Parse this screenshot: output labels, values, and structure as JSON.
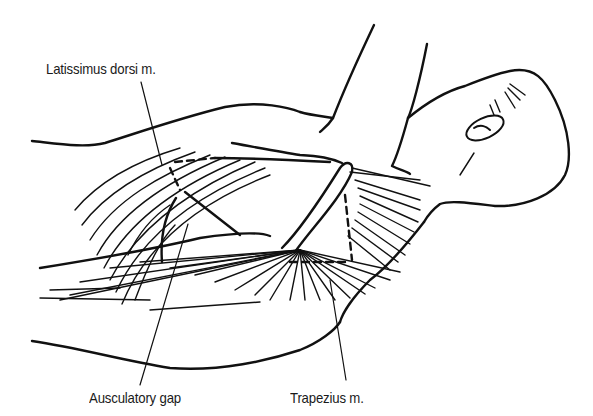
{
  "figure": {
    "labels": [
      {
        "id": "latissimus",
        "text": "Latissimus dorsi m.",
        "x": 46,
        "y": 60
      },
      {
        "id": "auscultatory",
        "text": "Ausculatory gap",
        "x": 89,
        "y": 389
      },
      {
        "id": "trapezius",
        "text": "Trapezius m.",
        "x": 290,
        "y": 389
      }
    ],
    "colors": {
      "line": "#111111",
      "background": "#ffffff",
      "text": "#1a1a1a"
    }
  }
}
